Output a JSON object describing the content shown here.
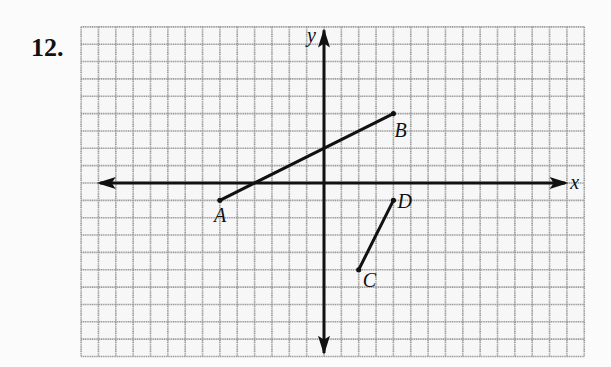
{
  "problem": {
    "number_label": "12."
  },
  "grid": {
    "x_min": -14,
    "x_max": 15,
    "y_min": -10,
    "y_max": 9,
    "cell_px": 17.35,
    "origin_px": [
      324,
      183
    ],
    "line_color": "#9a9a9a",
    "background": "#f7f7f7"
  },
  "axes": {
    "x_label": "x",
    "y_label": "y",
    "color": "#111111"
  },
  "chart_data": {
    "type": "line",
    "title": "12.",
    "xlabel": "x",
    "ylabel": "y",
    "xlim": [
      -14,
      15
    ],
    "ylim": [
      -10,
      9
    ],
    "grid": true,
    "tick_labels": "none",
    "series": [
      {
        "name": "segment AB",
        "points": [
          {
            "label": "A",
            "x": -6,
            "y": -1
          },
          {
            "label": "B",
            "x": 4,
            "y": 4
          }
        ]
      },
      {
        "name": "segment CD",
        "points": [
          {
            "label": "C",
            "x": 2,
            "y": -5
          },
          {
            "label": "D",
            "x": 4,
            "y": -1
          }
        ]
      }
    ]
  },
  "points": {
    "A": {
      "label": "A",
      "x": -6,
      "y": -1
    },
    "B": {
      "label": "B",
      "x": 4,
      "y": 4
    },
    "C": {
      "label": "C",
      "x": 2,
      "y": -5
    },
    "D": {
      "label": "D",
      "x": 4,
      "y": -1
    }
  }
}
